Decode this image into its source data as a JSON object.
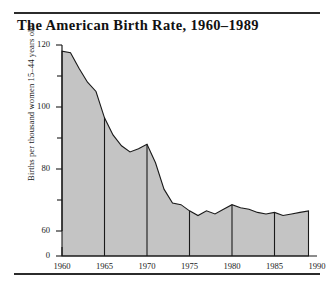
{
  "figure": {
    "title": "The American Birth Rate, 1960–1989",
    "has_top_rule": true,
    "has_bottom_rule": true
  },
  "colors": {
    "area_fill": "#c4c4c4",
    "area_stroke": "#1a1a1a",
    "axis": "#1a1a1a",
    "background": "#ffffff",
    "rule": "#2b2b2b",
    "text": "#1a1a1a"
  },
  "chart_data": {
    "type": "area",
    "title": "The American Birth Rate, 1960–1989",
    "xlabel": "",
    "ylabel": "Births per thousand women 15–44 years old",
    "xlim": [
      1960,
      1990
    ],
    "ylim": [
      60,
      120
    ],
    "y_axis_break": true,
    "y_axis_break_note": "axis broken between 0 and 60",
    "grid": false,
    "legend": "none",
    "ytick_labels": [
      "120",
      "100",
      "80",
      "60",
      "0"
    ],
    "ytick_values": [
      120,
      100,
      80,
      60,
      0
    ],
    "yminor_ticks": [
      110,
      90,
      70
    ],
    "xtick_labels": [
      "1960",
      "1965",
      "1970",
      "1975",
      "1980",
      "1985",
      "1990"
    ],
    "xtick_values": [
      1960,
      1965,
      1970,
      1975,
      1980,
      1985,
      1990
    ],
    "vertical_divider_years": [
      1965,
      1970,
      1975,
      1980,
      1985,
      1990
    ],
    "x": [
      1960,
      1961,
      1962,
      1963,
      1964,
      1965,
      1966,
      1967,
      1968,
      1969,
      1970,
      1971,
      1972,
      1973,
      1974,
      1975,
      1976,
      1977,
      1978,
      1979,
      1980,
      1981,
      1982,
      1983,
      1984,
      1985,
      1986,
      1987,
      1988,
      1989
    ],
    "values": [
      118,
      117.5,
      112.5,
      108,
      105,
      96.5,
      91,
      87.5,
      85.5,
      86.5,
      88,
      82,
      73.5,
      69,
      68.5,
      66.5,
      65,
      66.5,
      65.5,
      67,
      68.5,
      67.5,
      67,
      66,
      65.5,
      66,
      65,
      65.5,
      66,
      66.5
    ],
    "units": "births per 1,000 women aged 15–44"
  }
}
